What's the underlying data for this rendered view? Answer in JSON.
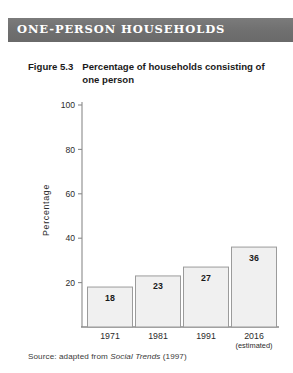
{
  "banner": {
    "title": "ONE-PERSON HOUSEHOLDS",
    "background_color": "#6f6f6f",
    "text_color": "#ffffff"
  },
  "caption": {
    "number": "Figure 5.3",
    "text": "Percentage of households consisting of one person"
  },
  "source": {
    "prefix": "Source: adapted from",
    "publication": "Social Trends",
    "year": "(1997)"
  },
  "chart_data": {
    "type": "bar",
    "title": "Percentage of households consisting of one person",
    "categories": [
      "1971",
      "1981",
      "1991",
      "2016"
    ],
    "category_notes": [
      "",
      "",
      "",
      "(estimated)"
    ],
    "values": [
      18,
      23,
      27,
      36
    ],
    "data_labels": [
      "18",
      "23",
      "27",
      "36"
    ],
    "xlabel": "",
    "ylabel": "Percentage",
    "ylim": [
      0,
      105
    ],
    "yticks": [
      20,
      40,
      60,
      80,
      100
    ],
    "ytick_labels": [
      "20",
      "40",
      "60",
      "80",
      "100"
    ],
    "grid": false,
    "legend": "none",
    "bar_fill_color": "#f0f0f0",
    "bar_border_color": "#9b9b9b",
    "axis_color": "#8a8a8a"
  }
}
